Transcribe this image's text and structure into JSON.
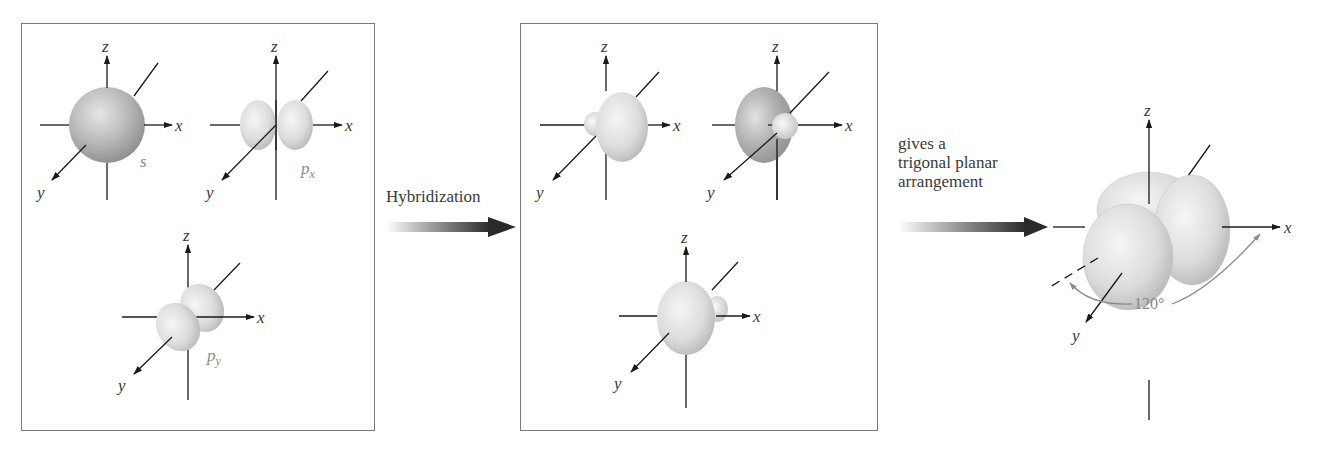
{
  "diagram": {
    "panels": {
      "atomic_orbitals": {
        "orbitals": [
          {
            "name": "s",
            "label": "s",
            "subscript": ""
          },
          {
            "name": "px",
            "label": "p",
            "subscript": "x"
          },
          {
            "name": "py",
            "label": "p",
            "subscript": "y"
          }
        ]
      },
      "hybrid_orbitals": {
        "count": 3,
        "label": ""
      }
    },
    "axes": {
      "x": "x",
      "y": "y",
      "z": "z"
    },
    "arrows": [
      {
        "label": "Hybridization"
      },
      {
        "label": "gives a\ntrigonal planar\narrangement"
      }
    ],
    "result": {
      "angle_label": "120°",
      "geometry": "trigonal planar"
    },
    "colors": {
      "border": "#7a7a7a",
      "axis": "#1a1a1a",
      "orbital_light": "#eeeeee",
      "orbital_mid": "#c8c8c8",
      "orbital_dark": "#9a9a9a",
      "angle_arc": "#8a8a8a"
    }
  }
}
